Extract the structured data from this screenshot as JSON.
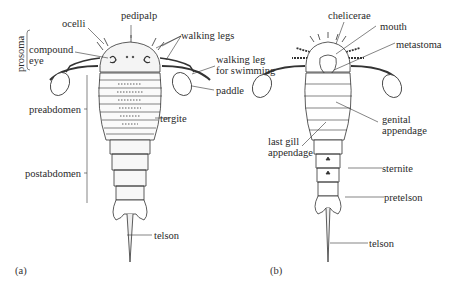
{
  "figure": {
    "panels": [
      {
        "id": "a",
        "label": "(a)",
        "view": "dorsal",
        "labels": {
          "ocelli": "ocelli",
          "pedipalp": "pedipalp",
          "walking_legs": "walking legs",
          "prosoma": "prosoma",
          "compound_eye_1": "compound",
          "compound_eye_2": "eye",
          "walking_leg_swim_1": "walking leg",
          "walking_leg_swim_2": "for swimming",
          "paddle": "paddle",
          "preabdomen": "preabdomen",
          "tergite": "tergite",
          "postabdomen": "postabdomen",
          "telson": "telson"
        }
      },
      {
        "id": "b",
        "label": "(b)",
        "view": "ventral",
        "labels": {
          "chelicerae": "chelicerae",
          "mouth": "mouth",
          "metastoma": "metastoma",
          "genital_1": "genital",
          "genital_2": "appendage",
          "last_gill_1": "last gill",
          "last_gill_2": "appendage",
          "sternite": "sternite",
          "pretelson": "pretelson",
          "telson": "telson"
        }
      }
    ],
    "caption_fragment": "(text cut off at bottom edge)"
  },
  "colors": {
    "ink": "#2a2a2a",
    "background": "#ffffff"
  }
}
